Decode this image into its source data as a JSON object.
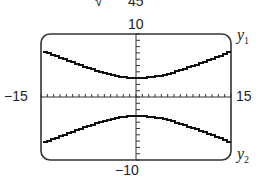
{
  "header_fragment": {
    "sqrt": "√",
    "denominator": "45"
  },
  "chart_data": {
    "type": "line",
    "title": "",
    "xlabel": "",
    "ylabel": "",
    "xlim": [
      -15,
      15
    ],
    "ylim": [
      -10,
      10
    ],
    "x_tick_scale": 1,
    "y_tick_scale": 1,
    "tick_labels": {
      "xmin": "−15",
      "xmax": "15",
      "ymax": "10",
      "ymin": "−10"
    },
    "series": [
      {
        "name": "y1",
        "formula": "3*sqrt(1 + x^2/45)",
        "x": [
          -15,
          -12,
          -9,
          -6,
          -3,
          0,
          3,
          6,
          9,
          12,
          15
        ],
        "values": [
          7.35,
          6.2,
          5.12,
          4.16,
          3.44,
          3.0,
          3.44,
          4.16,
          5.12,
          6.2,
          7.35
        ]
      },
      {
        "name": "y2",
        "formula": "-3*sqrt(1 + x^2/45)",
        "x": [
          -15,
          -12,
          -9,
          -6,
          -3,
          0,
          3,
          6,
          9,
          12,
          15
        ],
        "values": [
          -7.35,
          -6.2,
          -5.12,
          -4.16,
          -3.44,
          -3.0,
          -3.44,
          -4.16,
          -5.12,
          -6.2,
          -7.35
        ]
      }
    ],
    "legend": [
      {
        "label": "y",
        "sub": "1"
      },
      {
        "label": "y",
        "sub": "2"
      }
    ],
    "grid": false
  }
}
